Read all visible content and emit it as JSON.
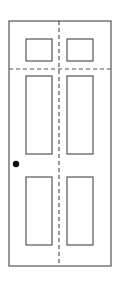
{
  "diagram": {
    "type": "six-panel door elevation",
    "colors": {
      "stroke": "#555555",
      "background": "#ffffff",
      "knob": "#111111"
    },
    "door_frame": {
      "x": 9,
      "y": 21,
      "width": 102,
      "height": 245
    },
    "center_line": {
      "orientation": "vertical",
      "style": "dashed",
      "x": 59
    },
    "rail_line": {
      "orientation": "horizontal",
      "style": "dashed",
      "y": 69
    },
    "panels": [
      {
        "name": "top-left",
        "x": 26,
        "y": 39,
        "width": 26,
        "height": 22
      },
      {
        "name": "top-right",
        "x": 67,
        "y": 39,
        "width": 26,
        "height": 22
      },
      {
        "name": "middle-left",
        "x": 26,
        "y": 76,
        "width": 26,
        "height": 78
      },
      {
        "name": "middle-right",
        "x": 67,
        "y": 76,
        "width": 26,
        "height": 78
      },
      {
        "name": "bottom-left",
        "x": 26,
        "y": 177,
        "width": 26,
        "height": 68
      },
      {
        "name": "bottom-right",
        "x": 67,
        "y": 177,
        "width": 26,
        "height": 68
      }
    ],
    "knob": {
      "cx": 16,
      "cy": 164,
      "r": 3.2
    }
  }
}
